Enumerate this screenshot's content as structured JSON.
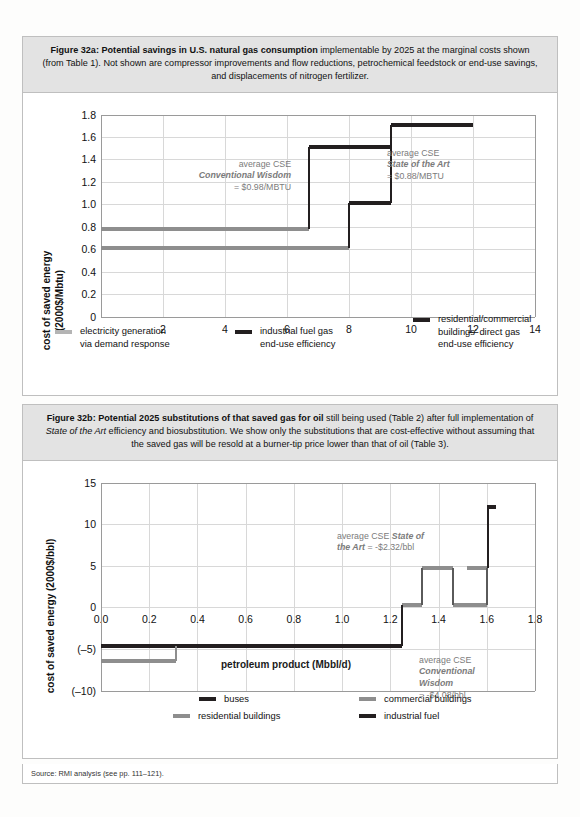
{
  "figure_a": {
    "caption_bold": "Figure 32a: Potential savings in U.S. natural gas consumption",
    "caption_rest": " implementable by 2025 at the marginal costs shown (from Table 1). Not shown are compressor improvements and flow reductions, petrochemical feedstock or end-use savings, and displacements of nitrogen fertilizer.",
    "annotations": [
      {
        "l1": "average CSE",
        "l2": "Conventional Wisdom",
        "l3": "= $0.98/MBTU"
      },
      {
        "l1": "average CSE",
        "l2": "State of the Art",
        "l3": "= $0.88/MBTU"
      }
    ],
    "legend": [
      {
        "label_l1": "electricity generation",
        "label_l2": "via demand response",
        "color": "#b4b4b4"
      },
      {
        "label_l1": "industrial fuel gas",
        "label_l2": "end-use efficiency",
        "color": "#231f20"
      },
      {
        "label_l1": "residential/commercial",
        "label_l2": "buildings' direct gas",
        "label_l3": "end-use efficiency",
        "color": "#231f20"
      }
    ]
  },
  "figure_b": {
    "caption_bold": "Figure 32b: Potential 2025 substitutions of that saved gas for oil",
    "caption_mid1": " still being used (Table 2) after full implementation of ",
    "caption_italic": "State of the Art",
    "caption_rest": " efficiency and biosubstitution. We show only the substitutions that are cost-effective without assuming that the saved gas will be resold at a burner-tip price lower than that of oil (Table 3).",
    "annotations": [
      {
        "l1": "average CSE State of",
        "l2": "the Art = -$2.32/bbl"
      },
      {
        "l1": "average CSE",
        "l2": "Conventional",
        "l3": "Wisdom",
        "l4": "= -$4.08/bbl"
      }
    ],
    "legend": [
      {
        "label": "buses",
        "color": "#231f20"
      },
      {
        "label": "commercial buildings",
        "color": "#8e8e8e"
      },
      {
        "label": "residential buildings",
        "color": "#8e8e8e"
      },
      {
        "label": "industrial fuel",
        "color": "#231f20"
      }
    ]
  },
  "source": "Source: RMI analysis (see pp. 111–121).",
  "chart_data": [
    {
      "id": "fig32a",
      "type": "line",
      "subtype": "step-supply-curve",
      "title": "Potential savings in U.S. natural gas consumption",
      "xlabel": "trillion cubic feet/y (TCF/y)",
      "ylabel": "cost of saved energy (2000$/Mbtu)",
      "xlim": [
        0,
        14
      ],
      "ylim": [
        0,
        1.8
      ],
      "xticks": [
        2,
        4,
        6,
        8,
        10,
        12,
        14
      ],
      "xticklabels": [
        "2",
        "4",
        "6",
        "8",
        "10",
        "12",
        "14"
      ],
      "yticks": [
        0,
        0.2,
        0.4,
        0.6,
        0.8,
        1.0,
        1.2,
        1.4,
        1.6,
        1.8
      ],
      "yticklabels": [
        "0",
        "0.2",
        "0.4",
        "0.6",
        "0.8",
        "1.0",
        "1.2",
        "1.4",
        "1.6",
        "1.8"
      ],
      "grid": true,
      "legend_position": "below",
      "series": [
        {
          "name": "electricity generation via demand response",
          "color": "#8e8e8e",
          "steps": [
            {
              "x0": 0.0,
              "x1": 6.7,
              "y": 0.78
            },
            {
              "x0": 0.0,
              "x1": 8.0,
              "y": 0.61
            }
          ]
        },
        {
          "name": "industrial fuel gas end-use efficiency",
          "color": "#231f20",
          "steps": [
            {
              "x0": 6.7,
              "x1": 9.35,
              "y": 1.51
            }
          ]
        },
        {
          "name": "residential/commercial buildings' direct gas end-use efficiency",
          "color": "#231f20",
          "steps": [
            {
              "x0": 8.0,
              "x1": 9.35,
              "y": 1.01
            },
            {
              "x0": 9.35,
              "x1": 12.0,
              "y": 1.71
            }
          ]
        }
      ]
    },
    {
      "id": "fig32b",
      "type": "line",
      "subtype": "step-supply-curve",
      "title": "Potential 2025 substitutions of that saved gas for oil",
      "xlabel": "petroleum product (Mbbl/d)",
      "ylabel": "cost of saved energy (2000$/bbl)",
      "xlim": [
        0.0,
        1.8
      ],
      "ylim": [
        -10,
        15
      ],
      "xticks": [
        0.0,
        0.2,
        0.4,
        0.6,
        0.8,
        1.0,
        1.2,
        1.4,
        1.6,
        1.8
      ],
      "xticklabels": [
        "0.0",
        "0.2",
        "0.4",
        "0.6",
        "0.8",
        "1.0",
        "1.2",
        "1.4",
        "1.6",
        "1.8"
      ],
      "yticks": [
        -10,
        -5,
        0,
        5,
        10,
        15
      ],
      "yticklabels": [
        "(–10)",
        "(–5)",
        "0",
        "5",
        "10",
        "15"
      ],
      "grid": true,
      "legend_position": "below",
      "series": [
        {
          "name": "industrial fuel",
          "color": "#231f20",
          "steps": [
            {
              "x0": 0.0,
              "x1": 1.25,
              "y": -4.6
            }
          ]
        },
        {
          "name": "residential buildings",
          "color": "#8e8e8e",
          "steps": [
            {
              "x0": 0.0,
              "x1": 0.31,
              "y": -6.4
            }
          ]
        },
        {
          "name": "commercial buildings",
          "color": "#8e8e8e",
          "steps": [
            {
              "x0": 1.25,
              "x1": 1.33,
              "y": 0.3
            },
            {
              "x0": 1.33,
              "x1": 1.46,
              "y": 4.7
            },
            {
              "x0": 1.46,
              "x1": 1.6,
              "y": 0.3
            },
            {
              "x0": 1.52,
              "x1": 1.6,
              "y": 4.7
            }
          ]
        },
        {
          "name": "buses",
          "color": "#231f20",
          "steps": [
            {
              "x0": 1.6,
              "x1": 1.64,
              "y": 12.1
            }
          ]
        }
      ]
    }
  ]
}
